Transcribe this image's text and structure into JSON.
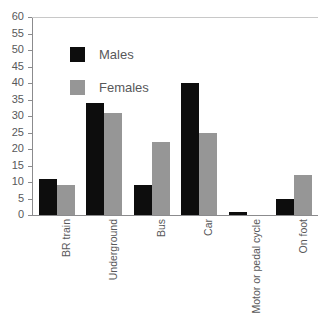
{
  "chart_data": {
    "type": "bar",
    "title": "",
    "subtitle": "",
    "xlabel": "",
    "ylabel": "",
    "categories": [
      "BR train",
      "Underground",
      "Bus",
      "Car",
      "Motor or pedal cycle",
      "On foot"
    ],
    "series": [
      {
        "name": "Males",
        "color": "#0d0d0d",
        "values": [
          11,
          34,
          9,
          40,
          1,
          5
        ]
      },
      {
        "name": "Females",
        "color": "#969696",
        "values": [
          9,
          31,
          22,
          25,
          0,
          12
        ]
      }
    ],
    "ylim": [
      0,
      60
    ],
    "ytick_step": 5,
    "ytick_labels": [
      "60",
      "55",
      "50",
      "45",
      "40",
      "35",
      "30",
      "25",
      "20",
      "15",
      "10",
      "5",
      "0"
    ],
    "grid": "top-line-only",
    "legend_position": "inside-upper-left",
    "axis_color": "#8b8b8d",
    "text_color": "#58585a",
    "background": "#ffffff"
  }
}
